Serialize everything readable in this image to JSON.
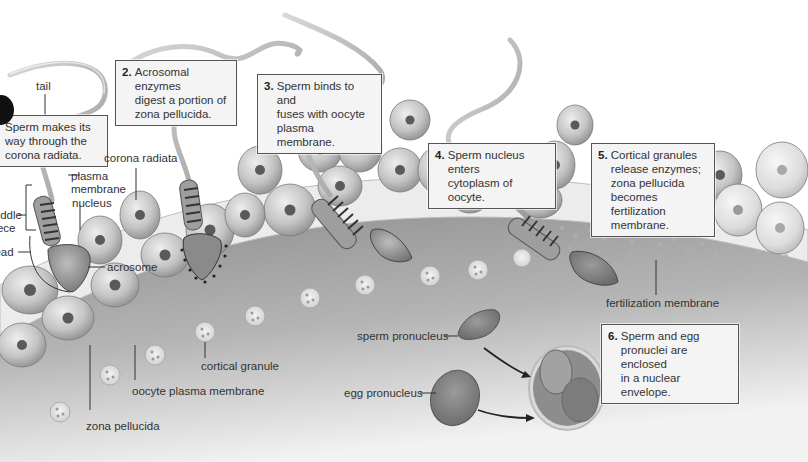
{
  "figure": {
    "color_mode": "grayscale",
    "colors": {
      "background": "#ffffff",
      "cells": "#c9c9c9",
      "zona_pellucida": "#ececec",
      "cytoplasm": "#9a9a9a",
      "box_fill": "#f4f4f4",
      "box_border": "#555555",
      "text": "#333333"
    }
  },
  "steps": [
    {
      "number": "1.",
      "text": "Sperm makes its\nway through the\ncorona radiata."
    },
    {
      "number": "2.",
      "text": "Acrosomal enzymes\ndigest a portion of\nzona pellucida."
    },
    {
      "number": "3.",
      "text": "Sperm binds to and\nfuses with oocyte\nplasma membrane."
    },
    {
      "number": "4.",
      "text": "Sperm nucleus enters\ncytoplasm of oocyte."
    },
    {
      "number": "5.",
      "text": "Cortical granules\nrelease enzymes;\nzona pellucida\nbecomes fertilization\nmembrane."
    },
    {
      "number": "6.",
      "text": "Sperm and egg\npronuclei are enclosed\nin a nuclear envelope."
    }
  ],
  "labels": {
    "tail": "tail",
    "plasma_membrane": "plasma\nmembrane",
    "nucleus": "nucleus",
    "middle_piece": "middle\npiece",
    "head": "head",
    "acrosome": "acrosome",
    "corona_radiata": "corona radiata",
    "cortical_granule": "cortical granule",
    "oocyte_plasma_membrane": "oocyte plasma membrane",
    "zona_pellucida": "zona pellucida",
    "fertilization_membrane": "fertilization membrane",
    "sperm_pronucleus": "sperm pronucleus",
    "egg_pronucleus": "egg pronucleus"
  }
}
